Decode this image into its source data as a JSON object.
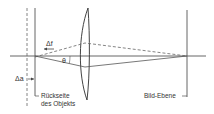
{
  "diagram": {
    "labels": {
      "delta_f": "Δf",
      "theta": "θ",
      "delta_a": "Δa",
      "rueckseite_line1": "Rückseite",
      "rueckseite_line2": "des Objekts",
      "bild_ebene": "Bild-Ebene"
    },
    "colors": {
      "line": "#555555",
      "text": "#333333"
    }
  }
}
